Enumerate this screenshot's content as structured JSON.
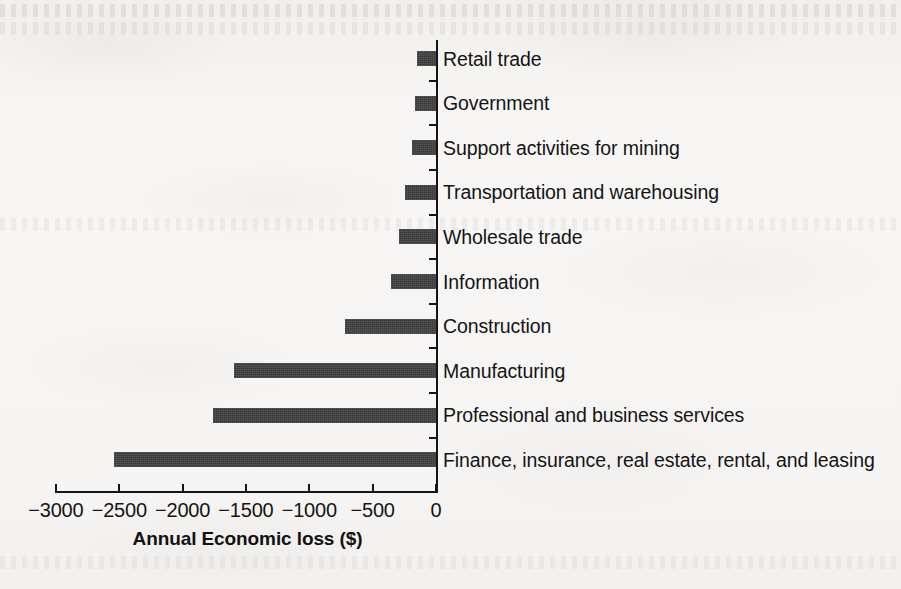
{
  "chart_data": {
    "type": "bar",
    "orientation": "horizontal",
    "title": "",
    "xlabel": "Annual Economic loss ($)",
    "ylabel": "",
    "xlim": [
      -3000,
      0
    ],
    "ylim": [
      0,
      10
    ],
    "grid": false,
    "legend": null,
    "bar_color": "#3a3a3a",
    "background_color": "#f6f5f3",
    "axis_color": "#151515",
    "xticks": [
      -3000,
      -2500,
      -2000,
      -1500,
      -1000,
      -500,
      0
    ],
    "xticklabels": [
      "−3000",
      "−2500",
      "−2000",
      "−1500",
      "−1000",
      "−500",
      "0"
    ],
    "categories": [
      "Retail trade",
      "Government",
      "Support activities for mining",
      "Transportation and warehousing",
      "Wholesale trade",
      "Information",
      "Construction",
      "Manufacturing",
      "Professional and business services",
      "Finance, insurance, real estate, rental, and leasing"
    ],
    "values": [
      -150,
      -168,
      -186,
      -246,
      -291,
      -352,
      -718,
      -1596,
      -1762,
      -2540
    ],
    "bars": [
      {
        "label": "Retail trade",
        "value": -150
      },
      {
        "label": "Government",
        "value": -168
      },
      {
        "label": "Support activities for mining",
        "value": -186
      },
      {
        "label": "Transportation and warehousing",
        "value": -246
      },
      {
        "label": "Wholesale trade",
        "value": -291
      },
      {
        "label": "Information",
        "value": -352
      },
      {
        "label": "Construction",
        "value": -718
      },
      {
        "label": "Manufacturing",
        "value": -1596
      },
      {
        "label": "Professional and business services",
        "value": -1762
      },
      {
        "label": "Finance, insurance, real estate, rental, and leasing",
        "value": -2540
      }
    ]
  },
  "axis": {
    "x_title": "Annual Economic loss ($)"
  }
}
